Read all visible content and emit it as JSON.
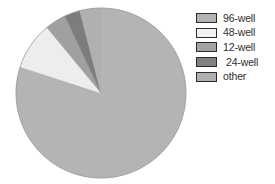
{
  "chart_data": {
    "type": "pie",
    "title": "",
    "categories": [
      "96-well",
      "48-well",
      "12-well",
      "24-well",
      "other"
    ],
    "values": [
      80,
      9,
      4,
      3,
      4
    ],
    "units": "percent",
    "start_angle_deg": 0,
    "direction": "clockwise",
    "colors": [
      "#b4b4b4",
      "#ededed",
      "#a0a0a0",
      "#7d7d7d",
      "#b0b0b0"
    ],
    "legend_position": "right",
    "grid": false,
    "xlabel": "",
    "ylabel": "",
    "annotations": []
  },
  "pie": {
    "center_x": 101,
    "center_y": 93,
    "radius": 85,
    "outline_color": "#9a9a9a",
    "slices": [
      {
        "name": "96-well",
        "value": 80,
        "color": "#b4b4b4",
        "start_deg": 0,
        "end_deg": 288
      },
      {
        "name": "48-well",
        "value": 9,
        "color": "#ededed",
        "start_deg": 288,
        "end_deg": 320.4
      },
      {
        "name": "12-well",
        "value": 4,
        "color": "#a0a0a0",
        "start_deg": 320.4,
        "end_deg": 334.8
      },
      {
        "name": "24-well",
        "value": 3,
        "color": "#7d7d7d",
        "start_deg": 334.8,
        "end_deg": 345.6
      },
      {
        "name": "other",
        "value": 4,
        "color": "#b0b0b0",
        "start_deg": 345.6,
        "end_deg": 360
      }
    ]
  },
  "legend": {
    "items": [
      {
        "label": "96-well",
        "swatch_color": "#b4b4b4",
        "swatch_name": "legend-swatch-96-well"
      },
      {
        "label": "48-well",
        "swatch_color": "#f2f2f2",
        "swatch_name": "legend-swatch-48-well"
      },
      {
        "label": "12-well",
        "swatch_color": "#a3a3a3",
        "swatch_name": "legend-swatch-12-well"
      },
      {
        "label": "24-well",
        "swatch_color": "#808080",
        "swatch_name": "legend-swatch-24-well"
      },
      {
        "label": "other",
        "swatch_color": "#b0b0b0",
        "swatch_name": "legend-swatch-other"
      }
    ]
  }
}
